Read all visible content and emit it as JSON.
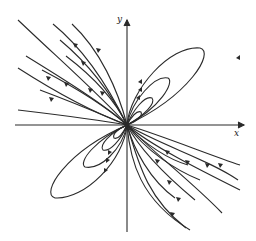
{
  "figure": {
    "type": "phase-portrait",
    "axes": {
      "x_label": "x",
      "y_label": "y",
      "origin": [
        127,
        125
      ]
    },
    "colors": {
      "line": "#2a2a2a",
      "background": "#ffffff"
    }
  }
}
